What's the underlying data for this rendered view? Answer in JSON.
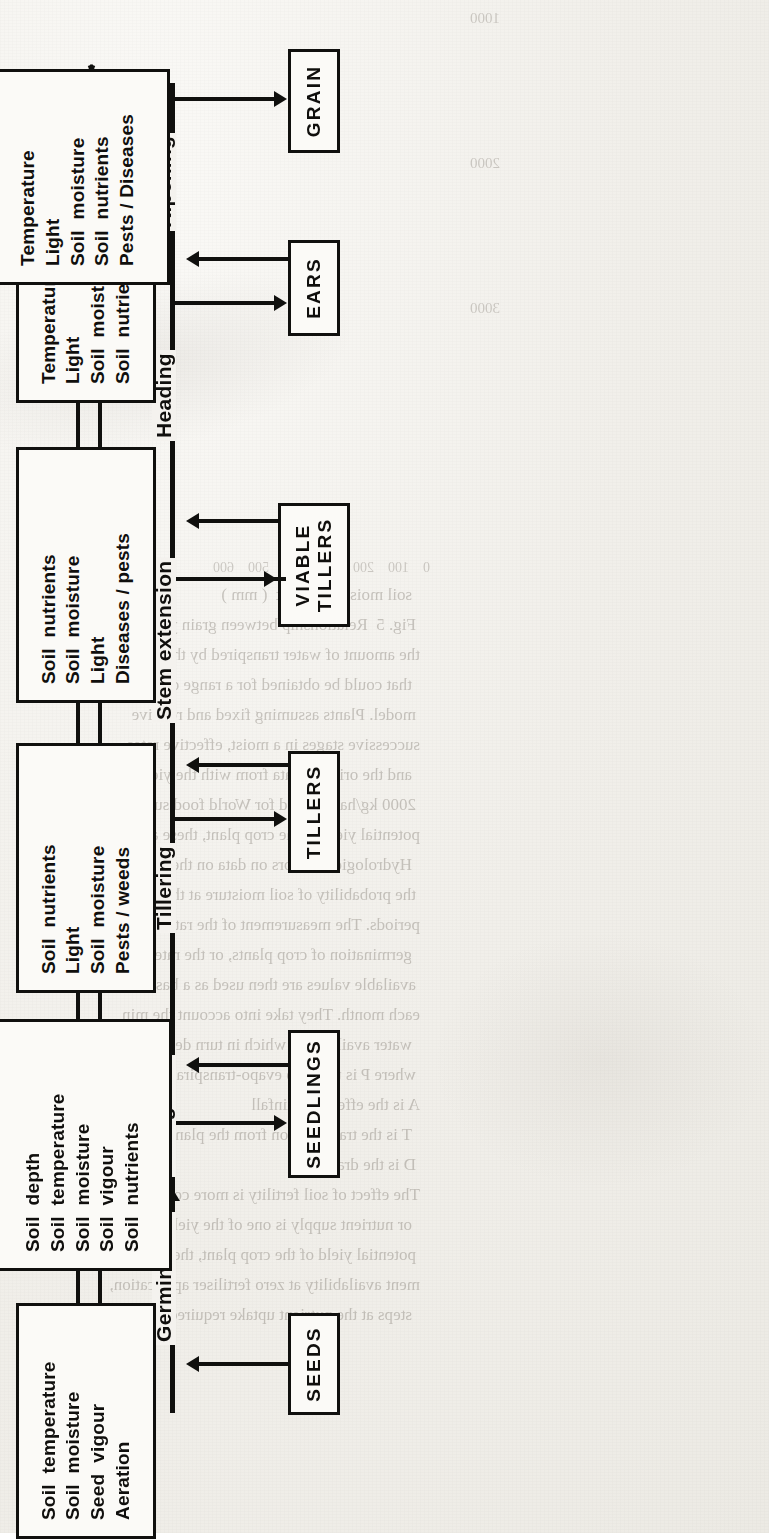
{
  "document": {
    "type": "scanned-book-page",
    "orientation": "figure rotated 90 degrees counter-clockwise",
    "figure_title": "Crop growth stages and the environmental factors affecting each transition"
  },
  "diagram": {
    "type": "flowchart",
    "direction": "left-to-right (in figure's own orientation)",
    "stage_boxes": [
      {
        "id": "seeds",
        "label": "SEEDS"
      },
      {
        "id": "seedlings",
        "label": "SEEDLINGS"
      },
      {
        "id": "tillers",
        "label": "TILLERS"
      },
      {
        "id": "viable-tillers",
        "label": "VIABLE\nTILLERS"
      },
      {
        "id": "ears",
        "label": "EARS"
      },
      {
        "id": "grain",
        "label": "GRAIN"
      }
    ],
    "transitions": [
      {
        "id": "germination",
        "label": "Germination",
        "from": "seeds",
        "to": "seedlings"
      },
      {
        "id": "emergence",
        "label": "Emergence",
        "from": "seedlings",
        "to": "seedlings"
      },
      {
        "id": "tillering",
        "label": "Tillering",
        "from": "seedlings",
        "to": "tillers"
      },
      {
        "id": "stem-extension",
        "label": "Stem extension",
        "from": "tillers",
        "to": "viable-tillers"
      },
      {
        "id": "heading",
        "label": "Heading",
        "from": "viable-tillers",
        "to": "ears"
      },
      {
        "id": "ripening",
        "label": "Ripening",
        "from": "ears",
        "to": "grain"
      }
    ],
    "factor_boxes": [
      {
        "id": "factors-germination",
        "feeds": "germination",
        "items": [
          "Soil  temperature",
          "Soil  moisture",
          "Seed  vigour",
          "Aeration"
        ]
      },
      {
        "id": "factors-emergence",
        "feeds": "emergence",
        "items": [
          "Soil  depth",
          "Soil  temperature",
          "Soil  moisture",
          "Soil  vigour",
          "Soil  nutrients"
        ]
      },
      {
        "id": "factors-tillering",
        "feeds": "tillering",
        "items": [
          "Soil  nutrients",
          "Light",
          "Soil  moisture",
          "Pests / weeds"
        ]
      },
      {
        "id": "factors-stem-extension",
        "feeds": "stem-extension",
        "items": [
          "Soil  nutrients",
          "Soil  moisture",
          "Light",
          "Diseases / pests"
        ]
      },
      {
        "id": "factors-heading",
        "feeds": "heading",
        "items": [
          "Temperature",
          "Light",
          "Soil  moisture",
          "Soil  nutrients"
        ]
      },
      {
        "id": "factors-ripening",
        "feeds": "ripening",
        "items": [
          "Temperature",
          "Light",
          "Soil  moisture",
          "Soil  nutrients",
          "Pests / Diseases"
        ]
      }
    ],
    "colors": {
      "ink": "#10100e",
      "box_fill": "#fbfaf7",
      "paper": "#f2f0ec",
      "ghost_text": "#6d665d"
    }
  },
  "background_text": {
    "note": "faint bleed-through text from the facing page, mirrored and illegible",
    "axis_ticks": [
      "0",
      "100",
      "200",
      "300",
      "400",
      "500",
      "600"
    ],
    "chart_ticks": [
      "1000",
      "2000",
      "3000"
    ],
    "lines": [
      "soil moisture deficit  ( mm )",
      "Fig. 5  Relationship between grain yield and",
      "the amount of water transpired by the crop",
      "that could be obtained for a range of",
      "model. Plants assuming fixed and relative",
      "successive stages in a moist, effective rates",
      "and the original data from with the yield",
      "2000 kg/ha reported for World food supply",
      "potential yield of the crop plant, these are cal-",
      "Hydrological factors on data on the geographic",
      "the probability of soil moisture at the time of",
      "periods. The measurement of the rate of soil",
      "germination of crop plants, or the rate at which",
      "available values are then used as a basis for",
      "each month. They take into account the min",
      "water availability, which in turn depends on",
      "where P is the crop evapo-transpiration rate",
      "A is the effective rainfall",
      "T is the transpiration from the plants",
      "D is the drainage",
      "The effect of soil fertility is more com-",
      "or nutrient supply is one of the yield-limiting",
      "potential yield of the crop plant, these are cal-",
      "ment availability at zero fertiliser application,",
      "steps at the nutrient uptake required to give a"
    ]
  }
}
